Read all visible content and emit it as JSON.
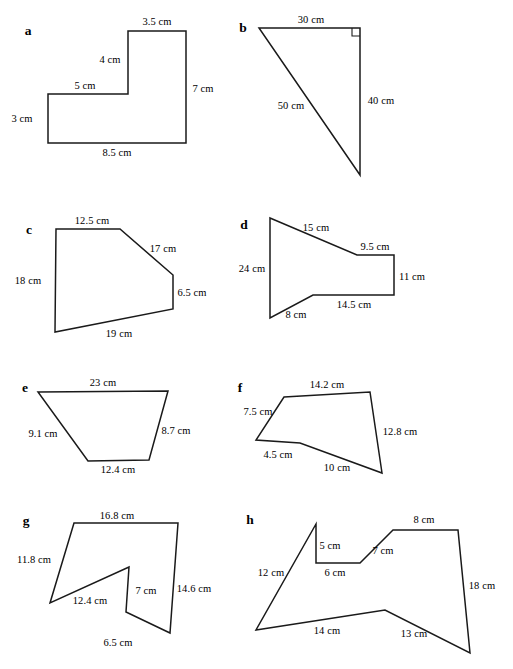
{
  "page": {
    "unit": "cm",
    "background_color": "#ffffff",
    "stroke_color": "#1a1a1a",
    "text_color": "#000000"
  },
  "figures": [
    {
      "id": "a",
      "letter": "a",
      "letter_pos": [
        28,
        31
      ],
      "shape": "L-shape hexagon",
      "points": "128,31 186,31 186,143 48,143 48,94 128,94",
      "closed": true,
      "right_angle": null,
      "labels": [
        {
          "text": "3.5 cm",
          "x": 157,
          "y": 22
        },
        {
          "text": "4 cm",
          "x": 110,
          "y": 60
        },
        {
          "text": "7 cm",
          "x": 203,
          "y": 89
        },
        {
          "text": "5 cm",
          "x": 85,
          "y": 86
        },
        {
          "text": "3 cm",
          "x": 22,
          "y": 119
        },
        {
          "text": "8.5 cm",
          "x": 117,
          "y": 153
        }
      ]
    },
    {
      "id": "b",
      "letter": "b",
      "letter_pos": [
        243,
        28
      ],
      "shape": "right triangle",
      "points": "259,28 360,28 360,175",
      "closed": true,
      "right_angle": {
        "x": 360,
        "y": 28,
        "size": 8,
        "dir_x": -1,
        "dir_y": 1
      },
      "labels": [
        {
          "text": "30 cm",
          "x": 311,
          "y": 20
        },
        {
          "text": "40 cm",
          "x": 381,
          "y": 101
        },
        {
          "text": "50 cm",
          "x": 291,
          "y": 106
        }
      ]
    },
    {
      "id": "c",
      "letter": "c",
      "letter_pos": [
        29,
        230
      ],
      "shape": "pentagon",
      "points": "56,229 120,229 173,275 173,309 55,332",
      "closed": true,
      "right_angle": null,
      "labels": [
        {
          "text": "12.5 cm",
          "x": 92,
          "y": 221
        },
        {
          "text": "17 cm",
          "x": 163,
          "y": 249
        },
        {
          "text": "18 cm",
          "x": 28,
          "y": 281
        },
        {
          "text": "6.5 cm",
          "x": 192,
          "y": 293
        },
        {
          "text": "19 cm",
          "x": 119,
          "y": 334
        }
      ]
    },
    {
      "id": "d",
      "letter": "d",
      "letter_pos": [
        244,
        225
      ],
      "shape": "hexagon",
      "points": "270,218 357,255 394,255 394,295 313,295 270,318",
      "closed": true,
      "right_angle": null,
      "labels": [
        {
          "text": "15 cm",
          "x": 316,
          "y": 228
        },
        {
          "text": "9.5 cm",
          "x": 375,
          "y": 247
        },
        {
          "text": "24 cm",
          "x": 252,
          "y": 269
        },
        {
          "text": "11 cm",
          "x": 412,
          "y": 277
        },
        {
          "text": "14.5 cm",
          "x": 354,
          "y": 305
        },
        {
          "text": "8 cm",
          "x": 296,
          "y": 315
        }
      ]
    },
    {
      "id": "e",
      "letter": "e",
      "letter_pos": [
        25,
        388
      ],
      "shape": "trapezoid",
      "points": "38,392 168,391 149,460 88,461",
      "closed": true,
      "right_angle": null,
      "labels": [
        {
          "text": "23 cm",
          "x": 103,
          "y": 383
        },
        {
          "text": "9.1 cm",
          "x": 43,
          "y": 434
        },
        {
          "text": "8.7 cm",
          "x": 176,
          "y": 431
        },
        {
          "text": "12.4 cm",
          "x": 118,
          "y": 470
        }
      ]
    },
    {
      "id": "f",
      "letter": "f",
      "letter_pos": [
        240,
        388
      ],
      "shape": "concave pentagon",
      "points": "284,397 370,392 382,473 300,443 256,440",
      "closed": true,
      "right_angle": null,
      "labels": [
        {
          "text": "14.2 cm",
          "x": 327,
          "y": 385
        },
        {
          "text": "7.5 cm",
          "x": 258,
          "y": 412
        },
        {
          "text": "12.8 cm",
          "x": 400,
          "y": 432
        },
        {
          "text": "4.5 cm",
          "x": 278,
          "y": 455
        },
        {
          "text": "10 cm",
          "x": 337,
          "y": 468
        }
      ]
    },
    {
      "id": "g",
      "letter": "g",
      "letter_pos": [
        26,
        521
      ],
      "shape": "concave hexagon",
      "points": "74,523 178,523 170,633 126,612 129,567 50,603",
      "closed": true,
      "right_angle": null,
      "labels": [
        {
          "text": "16.8 cm",
          "x": 117,
          "y": 516
        },
        {
          "text": "11.8 cm",
          "x": 34,
          "y": 560
        },
        {
          "text": "14.6 cm",
          "x": 194,
          "y": 589
        },
        {
          "text": "7 cm",
          "x": 146,
          "y": 591
        },
        {
          "text": "12.4 cm",
          "x": 90,
          "y": 601
        },
        {
          "text": "6.5 cm",
          "x": 118,
          "y": 643
        }
      ]
    },
    {
      "id": "h",
      "letter": "h",
      "letter_pos": [
        250,
        520
      ],
      "shape": "concave octagon",
      "points": "316,524 316,563 360,563 393,530 458,530 470,653 385,610 256,630",
      "closed": true,
      "right_angle": null,
      "labels": [
        {
          "text": "8 cm",
          "x": 424,
          "y": 520
        },
        {
          "text": "5 cm",
          "x": 330,
          "y": 546
        },
        {
          "text": "7 cm",
          "x": 383,
          "y": 551
        },
        {
          "text": "6 cm",
          "x": 335,
          "y": 573
        },
        {
          "text": "12 cm",
          "x": 271,
          "y": 573
        },
        {
          "text": "18 cm",
          "x": 482,
          "y": 586
        },
        {
          "text": "14 cm",
          "x": 327,
          "y": 631
        },
        {
          "text": "13 cm",
          "x": 414,
          "y": 634
        }
      ]
    }
  ]
}
